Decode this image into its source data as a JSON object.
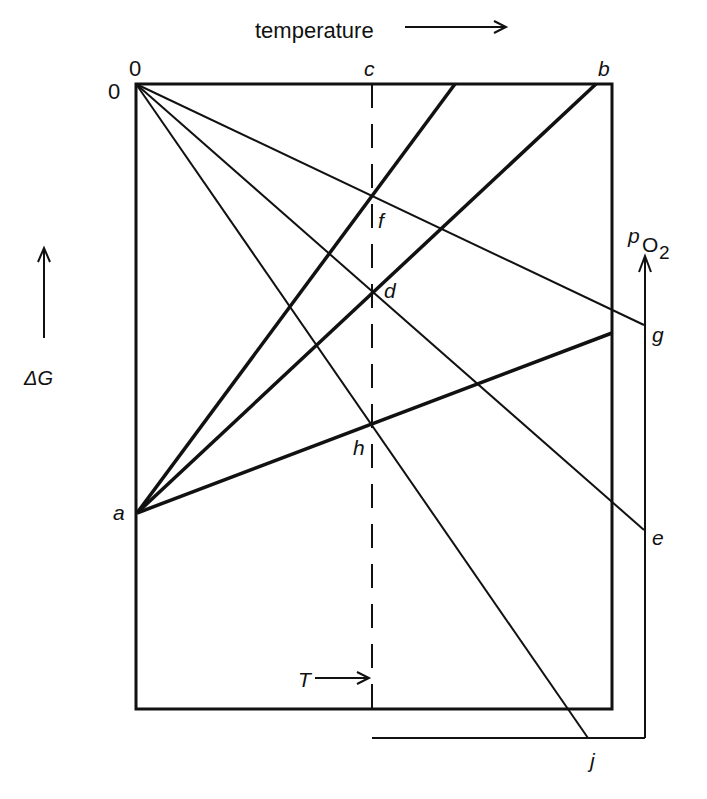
{
  "diagram": {
    "x_axis_label": "temperature",
    "y_axis_label": "ΔG",
    "pressure_axis_label_main": "p",
    "pressure_axis_label_sub": "O",
    "pressure_axis_label_subsub": "2",
    "temperature_marker_label": "T",
    "origin_top_label": "0",
    "origin_left_label": "0",
    "points": {
      "a": "a",
      "b": "b",
      "c": "c",
      "d": "d",
      "e": "e",
      "f": "f",
      "g": "g",
      "h": "h",
      "j": "j"
    },
    "colors": {
      "ink": "#111111",
      "background": "#ffffff"
    }
  }
}
